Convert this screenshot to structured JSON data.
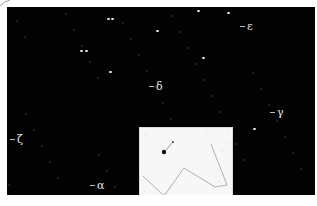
{
  "image": {
    "description": "Star field photograph with Greek-letter star labels and an inverted finder-chart inset",
    "background_color": "#030303",
    "border_color": "#ffffff"
  },
  "labels": [
    {
      "id": "epsilon",
      "symbol": "ε",
      "x": 246,
      "y": 26
    },
    {
      "id": "delta",
      "symbol": "δ",
      "x": 155,
      "y": 86
    },
    {
      "id": "gamma",
      "symbol": "γ",
      "x": 276,
      "y": 112
    },
    {
      "id": "zeta",
      "symbol": "ζ",
      "x": 16,
      "y": 139
    },
    {
      "id": "alpha",
      "symbol": "α",
      "x": 96,
      "y": 185
    }
  ],
  "bright_stars": [
    {
      "x": 108,
      "y": 19
    },
    {
      "x": 112,
      "y": 19
    },
    {
      "x": 81,
      "y": 51
    },
    {
      "x": 86,
      "y": 51
    },
    {
      "x": 198,
      "y": 11
    },
    {
      "x": 228,
      "y": 13
    },
    {
      "x": 203,
      "y": 58
    },
    {
      "x": 254,
      "y": 129
    },
    {
      "x": 157,
      "y": 31
    },
    {
      "x": 110,
      "y": 72
    }
  ],
  "inset": {
    "title": "",
    "background": "#f7f7f7",
    "line_color": "#b0b0b0",
    "polyline": [
      [
        142,
        175
      ],
      [
        163,
        195
      ],
      [
        183,
        167
      ],
      [
        214,
        186
      ],
      [
        226,
        184
      ],
      [
        210,
        143
      ]
    ],
    "marked_star": {
      "x": 163,
      "y": 151
    },
    "pointer_star": {
      "x": 172,
      "y": 141
    }
  }
}
